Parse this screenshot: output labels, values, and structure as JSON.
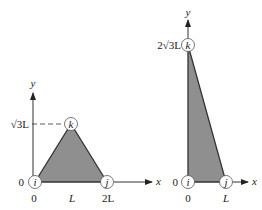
{
  "figures": [
    {
      "name": "equilateral-triangle-element",
      "axis_labels": {
        "x": "x",
        "y": "y"
      },
      "nodes": {
        "i": "i",
        "j": "j",
        "k": "k"
      },
      "x_ticks": [
        "0",
        "L",
        "2L"
      ],
      "y_ticks": {
        "origin": "0",
        "top": "√3L"
      },
      "vertices": {
        "i": [
          0,
          0
        ],
        "j": [
          "2L",
          0
        ],
        "k": [
          "L",
          "√3L"
        ]
      }
    },
    {
      "name": "right-triangle-element",
      "axis_labels": {
        "x": "x",
        "y": "y"
      },
      "nodes": {
        "i": "i",
        "j": "j",
        "k": "k"
      },
      "x_ticks": [
        "0",
        "L"
      ],
      "y_ticks": {
        "origin": "0",
        "top": "2√3L"
      },
      "vertices": {
        "i": [
          0,
          0
        ],
        "j": [
          "L",
          0
        ],
        "k": [
          0,
          "2√3L"
        ]
      }
    }
  ],
  "colors": {
    "fill": "#8f8f8f",
    "stroke": "#333333"
  }
}
